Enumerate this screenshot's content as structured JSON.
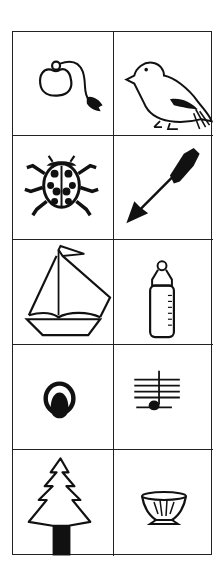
{
  "grid": {
    "rows": 5,
    "columns": 2,
    "line_color": "#222222",
    "background": "#ffffff",
    "cells": [
      {
        "row": 1,
        "col": 1,
        "icon": "perfume-atomizer-icon",
        "label": "perfume atomizer"
      },
      {
        "row": 1,
        "col": 2,
        "icon": "bird-icon",
        "label": "bird"
      },
      {
        "row": 2,
        "col": 1,
        "icon": "ladybug-icon",
        "label": "ladybug"
      },
      {
        "row": 2,
        "col": 2,
        "icon": "arrow-icon",
        "label": "arrow"
      },
      {
        "row": 3,
        "col": 1,
        "icon": "sailboat-icon",
        "label": "sailboat"
      },
      {
        "row": 3,
        "col": 2,
        "icon": "baby-bottle-icon",
        "label": "baby bottle"
      },
      {
        "row": 4,
        "col": 1,
        "icon": "ring-helmet-icon",
        "label": "round symbol"
      },
      {
        "row": 4,
        "col": 2,
        "icon": "music-note-icon",
        "label": "music note on staff"
      },
      {
        "row": 5,
        "col": 1,
        "icon": "pine-tree-icon",
        "label": "pine tree"
      },
      {
        "row": 5,
        "col": 2,
        "icon": "bowl-icon",
        "label": "bowl"
      }
    ]
  }
}
